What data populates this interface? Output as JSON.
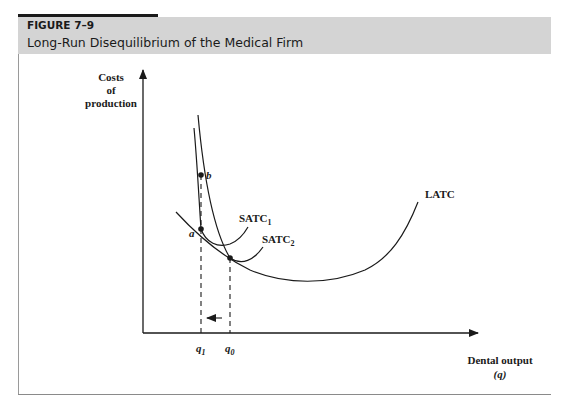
{
  "figure": {
    "number": "FIGURE 7–9",
    "title": "Long-Run Disequilibrium of the Medical Firm"
  },
  "axes": {
    "y_label_lines": [
      "Costs",
      "of",
      "production"
    ],
    "x_label": "Dental output",
    "x_label_var": "(q)"
  },
  "curves": {
    "latc": "LATC",
    "satc1": "SATC",
    "satc1_sub": "1",
    "satc2": "SATC",
    "satc2_sub": "2"
  },
  "points": {
    "a": "a",
    "b": "b"
  },
  "ticks": {
    "q1": "q",
    "q1_sub": "1",
    "q0": "q",
    "q0_sub": "0"
  },
  "colors": {
    "header_bg": "#d4d4d4",
    "ink": "#1a1a1a"
  }
}
